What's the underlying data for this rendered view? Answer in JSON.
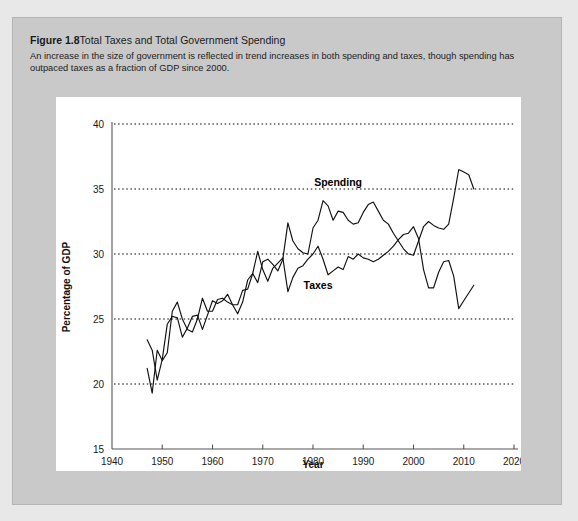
{
  "figure": {
    "number": "Figure 1.8",
    "title": "Total Taxes and Total Government Spending",
    "subtitle": "An increase in the size of government is reflected in trend increases in both spending and taxes, though spending has outpaced taxes as a fraction of GDP since 2000."
  },
  "chart_data": {
    "type": "line",
    "title": "Total Taxes and Total Government Spending",
    "xlabel": "Year",
    "ylabel": "Percentage of GDP",
    "xlim": [
      1940,
      2020
    ],
    "ylim": [
      15,
      40
    ],
    "xticks": [
      1940,
      1950,
      1960,
      1970,
      1980,
      1990,
      2000,
      2010,
      2020
    ],
    "yticks": [
      15,
      20,
      25,
      30,
      35,
      40
    ],
    "grid": "horizontal-dotted",
    "legend": "inline-labels",
    "annotations": [
      {
        "text": "Spending",
        "x": 1985,
        "y": 35.2
      },
      {
        "text": "Taxes",
        "x": 1981,
        "y": 27.3
      }
    ],
    "x": [
      1947,
      1948,
      1949,
      1950,
      1951,
      1952,
      1953,
      1954,
      1955,
      1956,
      1957,
      1958,
      1959,
      1960,
      1961,
      1962,
      1963,
      1964,
      1965,
      1966,
      1967,
      1968,
      1969,
      1970,
      1971,
      1972,
      1973,
      1974,
      1975,
      1976,
      1977,
      1978,
      1979,
      1980,
      1981,
      1982,
      1983,
      1984,
      1985,
      1986,
      1987,
      1988,
      1989,
      1990,
      1991,
      1992,
      1993,
      1994,
      1995,
      1996,
      1997,
      1998,
      1999,
      2000,
      2001,
      2002,
      2003,
      2004,
      2005,
      2006,
      2007,
      2008,
      2009,
      2010,
      2011,
      2012
    ],
    "series": [
      {
        "name": "Spending",
        "values": [
          21.2,
          19.3,
          22.6,
          21.8,
          22.4,
          25.6,
          26.3,
          25.0,
          24.2,
          24.0,
          25.0,
          26.6,
          25.6,
          25.6,
          26.5,
          26.6,
          26.3,
          26.1,
          25.4,
          26.3,
          28.0,
          28.5,
          27.8,
          29.4,
          29.6,
          29.2,
          28.7,
          29.6,
          32.4,
          31.0,
          30.4,
          30.1,
          30.0,
          32.0,
          32.6,
          34.1,
          33.7,
          32.6,
          33.3,
          33.2,
          32.6,
          32.3,
          32.4,
          33.2,
          33.8,
          34.0,
          33.3,
          32.6,
          32.3,
          31.6,
          31.0,
          30.4,
          30.0,
          29.9,
          31.0,
          32.1,
          32.5,
          32.2,
          32.0,
          31.9,
          32.3,
          34.3,
          36.5,
          36.3,
          36.1,
          35.0
        ]
      },
      {
        "name": "Taxes",
        "values": [
          23.4,
          22.6,
          20.3,
          21.9,
          24.6,
          25.2,
          25.1,
          23.6,
          24.3,
          25.2,
          25.3,
          24.2,
          25.3,
          26.4,
          26.2,
          26.4,
          26.9,
          26.1,
          26.1,
          27.2,
          27.3,
          28.5,
          30.2,
          28.8,
          27.9,
          28.9,
          29.3,
          29.7,
          27.1,
          28.2,
          28.9,
          29.1,
          29.6,
          30.0,
          30.6,
          29.6,
          28.4,
          28.7,
          29.0,
          28.8,
          29.8,
          29.6,
          30.0,
          29.7,
          29.6,
          29.4,
          29.6,
          29.9,
          30.2,
          30.6,
          31.1,
          31.5,
          31.6,
          32.1,
          31.2,
          28.8,
          27.4,
          27.4,
          28.6,
          29.4,
          29.5,
          28.3,
          25.8,
          26.4,
          27.0,
          27.6
        ]
      }
    ]
  }
}
